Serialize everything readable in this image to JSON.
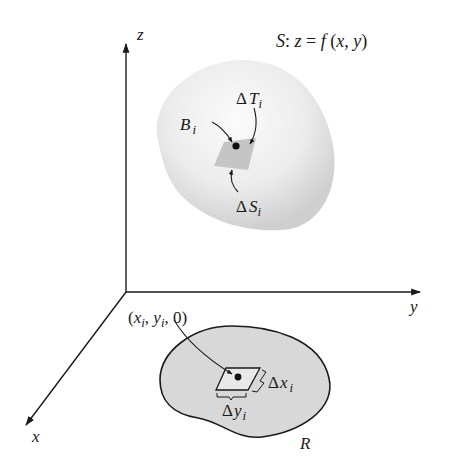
{
  "figure": {
    "surface_label": "S: z = f (x, y)",
    "surface_label_parts": {
      "S": "S",
      "colon": ":",
      "z": "z",
      "eq": " = ",
      "f": "f",
      "open": " (",
      "x": "x",
      "comma": ", ",
      "y": "y",
      "close": ")"
    },
    "axes": {
      "x": "x",
      "y": "y",
      "z": "z"
    },
    "surface_annotations": {
      "delta_T": {
        "delta": "Δ",
        "sym": "T",
        "sub": "i"
      },
      "B": {
        "sym": "B",
        "sub": "i"
      },
      "delta_S": {
        "delta": "Δ",
        "sym": "S",
        "sub": "i"
      }
    },
    "region_annotations": {
      "point": {
        "open": "(",
        "x": "x",
        "xsub": "i",
        "comma1": ", ",
        "y": "y",
        "ysub": "i",
        "rest": ", 0)"
      },
      "delta_x": {
        "delta": "Δ",
        "sym": "x",
        "sub": "i"
      },
      "delta_y": {
        "delta": "Δ",
        "sym": "y",
        "sub": "i"
      },
      "region": "R"
    },
    "colors": {
      "axis": "#1a1a1a",
      "surface_fill": "#e6e6e6",
      "patch_fill": "#c4c4c4",
      "region_fill": "#d9d9d9"
    }
  }
}
